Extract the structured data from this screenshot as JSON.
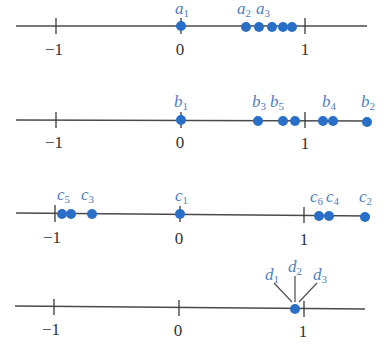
{
  "style": {
    "point_color": "#2a6fc7",
    "label_color": "#4f7fc0",
    "axis_color": "#4a4a4a"
  },
  "tick_labels": {
    "minus_one": "−1",
    "zero": "0",
    "one": "1"
  },
  "rows": [
    {
      "name": "sequence-a",
      "labels": [
        {
          "base": "a",
          "sub": "1"
        },
        {
          "base": "a",
          "sub": "2"
        },
        {
          "base": "a",
          "sub": "3"
        }
      ],
      "points_approx": [
        0,
        0.52,
        0.63,
        0.74,
        0.82,
        0.88
      ]
    },
    {
      "name": "sequence-b",
      "labels": [
        {
          "base": "b",
          "sub": "1"
        },
        {
          "base": "b",
          "sub": "3"
        },
        {
          "base": "b",
          "sub": "5"
        },
        {
          "base": "b",
          "sub": "4"
        },
        {
          "base": "b",
          "sub": "2"
        }
      ],
      "points_approx": [
        0,
        0.62,
        0.82,
        0.92,
        1.14,
        1.22,
        1.5
      ]
    },
    {
      "name": "sequence-c",
      "labels": [
        {
          "base": "c",
          "sub": "5"
        },
        {
          "base": "c",
          "sub": "3"
        },
        {
          "base": "c",
          "sub": "1"
        },
        {
          "base": "c",
          "sub": "6"
        },
        {
          "base": "c",
          "sub": "4"
        },
        {
          "base": "c",
          "sub": "2"
        }
      ],
      "points_approx": [
        -0.95,
        -0.88,
        -0.71,
        0,
        1.11,
        1.2,
        1.49
      ]
    },
    {
      "name": "sequence-d",
      "labels": [
        {
          "base": "d",
          "sub": "1"
        },
        {
          "base": "d",
          "sub": "2"
        },
        {
          "base": "d",
          "sub": "3"
        }
      ],
      "points_approx": [
        0.92
      ]
    }
  ]
}
